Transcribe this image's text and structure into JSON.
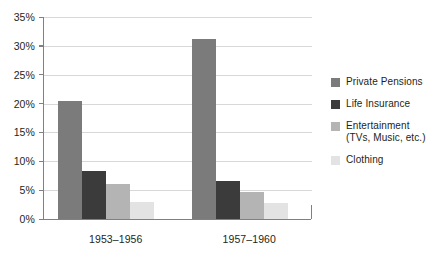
{
  "chart_data": {
    "type": "bar",
    "title": "",
    "subtitle": "",
    "xlabel": "",
    "ylabel": "",
    "categories": [
      "1953–1956",
      "1957–1960"
    ],
    "series": [
      {
        "name": "Private Pensions",
        "values": [
          20.5,
          31.2
        ],
        "color": "#7b7b7b"
      },
      {
        "name": "Life Insurance",
        "values": [
          8.4,
          6.6
        ],
        "color": "#3b3b3b"
      },
      {
        "name": "Entertainment (TVs, Music, etc.)",
        "values": [
          6.0,
          4.7
        ],
        "color": "#b4b4b4"
      },
      {
        "name": "Clothing",
        "values": [
          3.0,
          2.7
        ],
        "color": "#e3e3e3"
      }
    ],
    "ylim": [
      0,
      35
    ],
    "ytick_values": [
      0,
      5,
      10,
      15,
      20,
      25,
      30,
      35
    ],
    "ytick_labels": [
      "0%",
      "5%",
      "10%",
      "15%",
      "20%",
      "25%",
      "30%",
      "35%"
    ],
    "grid": true,
    "legend_position": "right",
    "value_suffix": "%"
  },
  "legend": {
    "items": [
      {
        "label": "Private Pensions",
        "label_line2": ""
      },
      {
        "label": "Life Insurance",
        "label_line2": ""
      },
      {
        "label": "Entertainment",
        "label_line2": "(TVs, Music, etc.)"
      },
      {
        "label": "Clothing",
        "label_line2": ""
      }
    ]
  },
  "axis": {
    "y_labels": [
      "35%",
      "30%",
      "25%",
      "20%",
      "15%",
      "10%",
      "5%",
      "0%"
    ],
    "x_labels": [
      "1953–1956",
      "1957–1960"
    ]
  },
  "colors": {
    "grid": "#d8d8d8",
    "axis": "#808080",
    "text": "#231f20",
    "background": "#ffffff"
  }
}
